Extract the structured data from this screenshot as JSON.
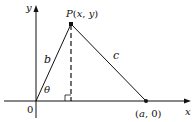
{
  "diagram": {
    "labels": {
      "y_axis": "y",
      "x_axis": "x",
      "origin": "0",
      "point_p": "P(x, y)",
      "point_a": "(a, 0)",
      "side_b": "b",
      "side_c": "c",
      "angle": "θ"
    },
    "points": {
      "origin": [
        36,
        101
      ],
      "P": [
        71,
        24
      ],
      "A": [
        146,
        101
      ]
    },
    "colors": {
      "stroke": "#111111",
      "background": "#ffffff"
    }
  }
}
